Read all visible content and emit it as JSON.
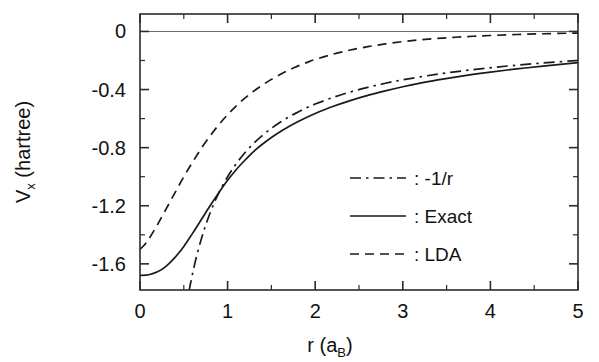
{
  "chart_data": {
    "type": "line",
    "title": "",
    "xlabel": "r (a_B)",
    "xlabel_main": "r (a",
    "xlabel_sub": "B",
    "xlabel_tail": ")",
    "ylabel": "V_x (hartree)",
    "ylabel_main": "V",
    "ylabel_sub": "x",
    "ylabel_tail": " (hartree)",
    "xlim": [
      0,
      5
    ],
    "ylim": [
      -1.78,
      0.12
    ],
    "xticks": [
      0,
      1,
      2,
      3,
      4,
      5
    ],
    "xtick_labels": [
      "0",
      "1",
      "2",
      "3",
      "4",
      "5"
    ],
    "yticks": [
      0,
      -0.4,
      -0.8,
      -1.2,
      -1.6
    ],
    "ytick_labels": [
      "0",
      "-0.4",
      "-0.8",
      "-1.2",
      "-1.6"
    ],
    "x_minor_step": 0.5,
    "y_minor_step": 0.2,
    "grid": false,
    "zero_reference_line": true,
    "legend_position": "center-right",
    "series": [
      {
        "name": "-1/r",
        "label": ": -1/r",
        "style": "dashdot",
        "color": "#1a1a1a",
        "x": [
          0.56,
          0.6,
          0.65,
          0.7,
          0.75,
          0.8,
          0.85,
          0.9,
          1.0,
          1.1,
          1.2,
          1.3,
          1.4,
          1.5,
          1.6,
          1.7,
          1.8,
          1.9,
          2.0,
          2.2,
          2.4,
          2.6,
          2.8,
          3.0,
          3.4,
          3.8,
          4.2,
          4.6,
          5.0
        ],
        "y": [
          -1.786,
          -1.667,
          -1.538,
          -1.429,
          -1.333,
          -1.25,
          -1.176,
          -1.111,
          -1.0,
          -0.909,
          -0.833,
          -0.769,
          -0.714,
          -0.667,
          -0.625,
          -0.588,
          -0.556,
          -0.526,
          -0.5,
          -0.455,
          -0.417,
          -0.385,
          -0.357,
          -0.333,
          -0.294,
          -0.263,
          -0.238,
          -0.217,
          -0.2
        ]
      },
      {
        "name": "Exact",
        "label": ": Exact",
        "style": "solid",
        "color": "#1a1a1a",
        "x": [
          0.0,
          0.1,
          0.2,
          0.3,
          0.4,
          0.5,
          0.6,
          0.7,
          0.8,
          0.9,
          1.0,
          1.1,
          1.2,
          1.3,
          1.4,
          1.5,
          1.6,
          1.7,
          1.8,
          1.9,
          2.0,
          2.2,
          2.4,
          2.6,
          2.8,
          3.0,
          3.2,
          3.4,
          3.6,
          3.8,
          4.0,
          4.3,
          4.6,
          5.0
        ],
        "y": [
          -1.68,
          -1.675,
          -1.655,
          -1.615,
          -1.555,
          -1.48,
          -1.39,
          -1.295,
          -1.2,
          -1.11,
          -1.025,
          -0.95,
          -0.885,
          -0.825,
          -0.775,
          -0.73,
          -0.69,
          -0.655,
          -0.622,
          -0.592,
          -0.565,
          -0.517,
          -0.476,
          -0.44,
          -0.409,
          -0.381,
          -0.356,
          -0.334,
          -0.314,
          -0.296,
          -0.28,
          -0.258,
          -0.239,
          -0.215
        ]
      },
      {
        "name": "LDA",
        "label": ": LDA",
        "style": "dashed",
        "color": "#1a1a1a",
        "x": [
          0.0,
          0.05,
          0.1,
          0.2,
          0.3,
          0.4,
          0.5,
          0.6,
          0.7,
          0.8,
          0.9,
          1.0,
          1.1,
          1.2,
          1.3,
          1.4,
          1.5,
          1.6,
          1.7,
          1.8,
          1.9,
          2.0,
          2.2,
          2.4,
          2.6,
          2.8,
          3.0,
          3.2,
          3.4,
          3.6,
          3.8,
          4.0,
          4.3,
          4.6,
          5.0
        ],
        "y": [
          -1.5,
          -1.47,
          -1.43,
          -1.33,
          -1.22,
          -1.11,
          -1.0,
          -0.9,
          -0.805,
          -0.72,
          -0.642,
          -0.573,
          -0.512,
          -0.458,
          -0.41,
          -0.368,
          -0.33,
          -0.296,
          -0.266,
          -0.239,
          -0.215,
          -0.193,
          -0.157,
          -0.128,
          -0.105,
          -0.086,
          -0.07,
          -0.058,
          -0.048,
          -0.04,
          -0.033,
          -0.028,
          -0.021,
          -0.016,
          -0.011
        ]
      }
    ]
  },
  "legend": {
    "entries": [
      {
        "label": ": -1/r",
        "style": "dashdot"
      },
      {
        "label": ": Exact",
        "style": "solid"
      },
      {
        "label": ": LDA",
        "style": "dashed"
      }
    ]
  }
}
